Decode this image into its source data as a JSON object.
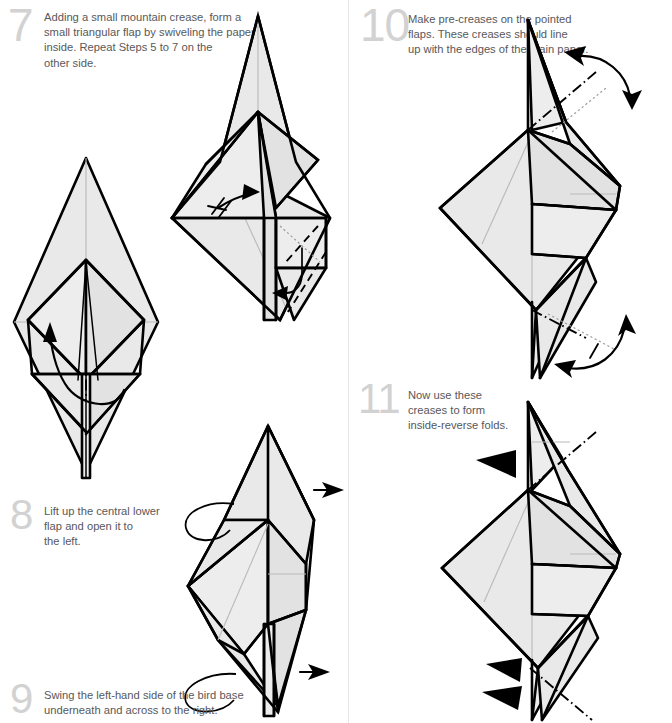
{
  "page": {
    "width": 672,
    "height": 723,
    "background": "#ffffff",
    "divider_color": "#e6e6e6",
    "paper_fill": "#e9e9e9",
    "ink_color": "#000000",
    "text_color": "#58585a",
    "step_number_color": "#d2d2d2"
  },
  "steps": [
    {
      "number": "7",
      "text": "Adding a small mountain crease, form a\nsmall triangular flap by swiveling the paper\ninside. Repeat Steps 5 to 7 on the\nother side.",
      "column": "left",
      "figures": [
        {
          "name": "bird-base-with-mountain-crease",
          "caption": ""
        },
        {
          "name": "swiveled-flap-result",
          "caption": ""
        }
      ],
      "markings": [
        "mountain-crease-line",
        "swivel-arrow",
        "hatch-marks",
        "tuck-in-curl-arrow",
        "valley-crease-line"
      ]
    },
    {
      "number": "8",
      "text": "Lift up the central lower\nflap and open it to\nthe left.",
      "column": "left",
      "figures": [
        {
          "name": "lift-central-flap",
          "caption": ""
        }
      ],
      "markings": [
        "mountain-crease-line",
        "loop-arrow",
        "straight-arrow"
      ]
    },
    {
      "number": "9",
      "text": "Swing the left-hand side of the bird base\nunderneath and across to the right.",
      "column": "left",
      "figures": [
        {
          "name": "swing-left-side-across",
          "caption": ""
        }
      ],
      "markings": [
        "loop-arrow-top",
        "loop-arrow-bottom",
        "straight-arrow"
      ]
    },
    {
      "number": "10",
      "text": "Make pre-creases on the pointed\nflaps. These creases should line\nup with the edges of the main paper.",
      "column": "right",
      "figures": [
        {
          "name": "pre-crease-pointed-flaps",
          "caption": ""
        }
      ],
      "markings": [
        "double-headed-arrow-top",
        "double-headed-arrow-bottom",
        "dotted-reference-line",
        "mountain-crease-line",
        "tick-mark"
      ]
    },
    {
      "number": "11",
      "text": "Now use these\ncreases to form\ninside-reverse folds.",
      "column": "right",
      "figures": [
        {
          "name": "inside-reverse-folds",
          "caption": ""
        }
      ],
      "markings": [
        "push-arrow-top",
        "push-arrow-bottom-upper",
        "push-arrow-bottom-lower",
        "mountain-crease-line-top",
        "mountain-crease-line-bottom"
      ]
    }
  ]
}
